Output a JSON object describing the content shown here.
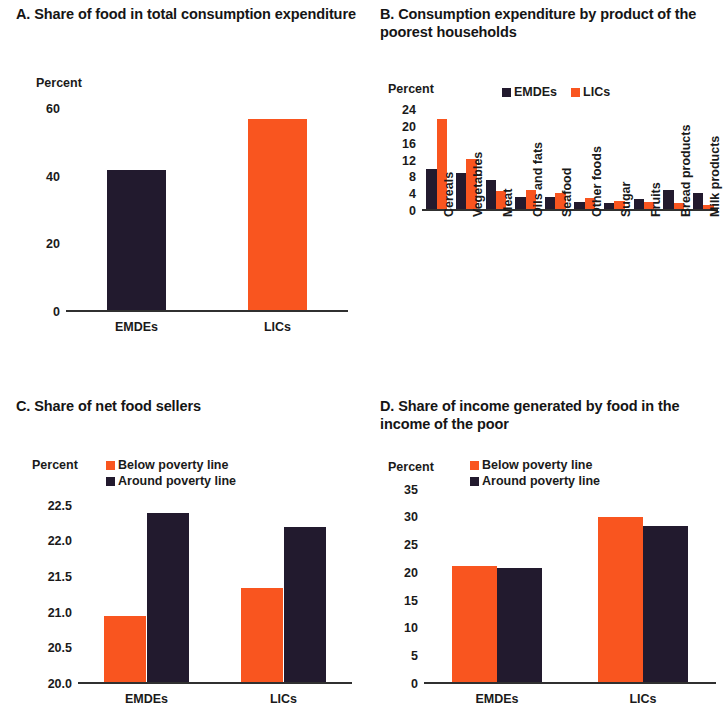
{
  "colors": {
    "emdes_dark": "#221a2e",
    "lics_orange": "#f9551f",
    "axis": "#303030",
    "background": "#ffffff"
  },
  "panels": {
    "a": {
      "title": "A. Share of food in total consumption expenditure",
      "axis_label": "Percent",
      "legend": [],
      "chart_data": {
        "type": "bar",
        "title": "A. Share of food in total consumption expenditure",
        "xlabel": "",
        "ylabel": "Percent",
        "ylim": [
          0,
          62
        ],
        "yticks": [
          0,
          20,
          40,
          60
        ],
        "ytick_labels": [
          "0",
          "20",
          "40",
          "60"
        ],
        "grid": false,
        "legend_position": "none",
        "categories": [
          "EMDEs",
          "LICs"
        ],
        "values": [
          42,
          57
        ],
        "bar_colors": [
          "#221a2e",
          "#f9551f"
        ]
      }
    },
    "b": {
      "title": "B. Consumption expenditure by product of the poorest households",
      "axis_label": "Percent",
      "legend": [
        {
          "label": "EMDEs",
          "color": "#221a2e"
        },
        {
          "label": "LICs",
          "color": "#f9551f"
        }
      ],
      "chart_data": {
        "type": "bar",
        "title": "B. Consumption expenditure by product of the poorest households",
        "xlabel": "",
        "ylabel": "Percent",
        "ylim": [
          0,
          25
        ],
        "yticks": [
          0,
          4,
          8,
          12,
          16,
          20,
          24
        ],
        "ytick_labels": [
          "0",
          "4",
          "8",
          "12",
          "16",
          "20",
          "24"
        ],
        "grid": false,
        "legend_position": "top-right",
        "categories": [
          "Cereals",
          "Vegetables",
          "Meat",
          "Oils and fats",
          "Seafood",
          "Other foods",
          "Sugar",
          "Fruits",
          "Bread products",
          "Milk products"
        ],
        "series": [
          {
            "name": "EMDEs",
            "color": "#221a2e",
            "values": [
              10.0,
              9.0,
              7.5,
              3.3,
              3.4,
              2.2,
              1.8,
              2.8,
              5.1,
              4.4
            ]
          },
          {
            "name": "LICs",
            "color": "#f9551f",
            "values": [
              22.0,
              12.3,
              4.7,
              4.9,
              4.3,
              3.0,
              2.3,
              2.2,
              1.8,
              1.5
            ]
          }
        ]
      }
    },
    "c": {
      "title": "C. Share of net food sellers",
      "axis_label": "Percent",
      "legend": [
        {
          "label": "Below poverty line",
          "color": "#f9551f"
        },
        {
          "label": "Around poverty line",
          "color": "#221a2e"
        }
      ],
      "chart_data": {
        "type": "bar",
        "title": "C. Share of net food sellers",
        "xlabel": "",
        "ylabel": "Percent",
        "ylim": [
          20.0,
          22.75
        ],
        "yticks": [
          20.0,
          20.5,
          21.0,
          21.5,
          22.0,
          22.5
        ],
        "ytick_labels": [
          "20.0",
          "20.5",
          "21.0",
          "21.5",
          "22.0",
          "22.5"
        ],
        "grid": false,
        "legend_position": "top-center",
        "categories": [
          "EMDEs",
          "LICs"
        ],
        "series": [
          {
            "name": "Below poverty line",
            "color": "#f9551f",
            "values": [
              20.95,
              21.35
            ]
          },
          {
            "name": "Around poverty line",
            "color": "#221a2e",
            "values": [
              22.4,
              22.2
            ]
          }
        ]
      }
    },
    "d": {
      "title": "D. Share of income generated by food in the income of the poor",
      "axis_label": "Percent",
      "legend": [
        {
          "label": "Below poverty line",
          "color": "#f9551f"
        },
        {
          "label": "Around poverty line",
          "color": "#221a2e"
        }
      ],
      "chart_data": {
        "type": "bar",
        "title": "D. Share of income generated by food in the income of the poor",
        "xlabel": "",
        "ylabel": "Percent",
        "ylim": [
          0,
          36
        ],
        "yticks": [
          0,
          5,
          10,
          15,
          20,
          25,
          30,
          35
        ],
        "ytick_labels": [
          "0",
          "5",
          "10",
          "15",
          "20",
          "25",
          "30",
          "35"
        ],
        "grid": false,
        "legend_position": "top-center",
        "categories": [
          "EMDEs",
          "LICs"
        ],
        "series": [
          {
            "name": "Below poverty line",
            "color": "#f9551f",
            "values": [
              21.2,
              30.0
            ]
          },
          {
            "name": "Around poverty line",
            "color": "#221a2e",
            "values": [
              20.8,
              28.5
            ]
          }
        ]
      }
    }
  }
}
